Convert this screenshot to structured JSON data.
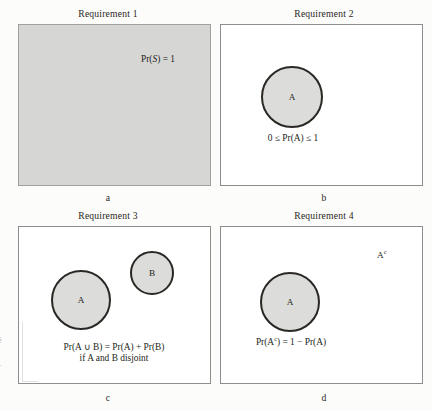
{
  "figure": {
    "background_color": "#fcfcfa",
    "fill_gray": "#d6d6d4",
    "circle_fill": "#dcdcda",
    "circle_stroke": "#2a2724",
    "box_stroke": "#8d8d8d",
    "text_color": "#231f20"
  },
  "panels": [
    {
      "id": "a",
      "title": "Requirement 1",
      "label": "a",
      "box_filled": true,
      "formulas": [
        {
          "text": "Pr(S) = 1"
        }
      ],
      "circles": []
    },
    {
      "id": "b",
      "title": "Requirement 2",
      "label": "b",
      "box_filled": false,
      "formulas": [
        {
          "text": "0 ≤ Pr(A) ≤ 1"
        }
      ],
      "circles": [
        {
          "label": "A"
        }
      ]
    },
    {
      "id": "c",
      "title": "Requirement 3",
      "label": "c",
      "box_filled": false,
      "formulas": [
        {
          "text": "Pr(A ∪ B) = Pr(A) + Pr(B)"
        },
        {
          "text": "if A and B disjoint"
        }
      ],
      "circles": [
        {
          "label": "A"
        },
        {
          "label": "B"
        }
      ]
    },
    {
      "id": "d",
      "title": "Requirement 4",
      "label": "d",
      "box_filled": false,
      "formulas": [
        {
          "text": "Pr(A",
          "sup": "c",
          "text2": ") = 1 − Pr(A)"
        }
      ],
      "circles": [
        {
          "label": "A"
        }
      ],
      "complement_label": {
        "base": "A",
        "sup": "c"
      }
    }
  ],
  "margin_fragments": [
    "é",
    "·",
    "r",
    "l"
  ]
}
